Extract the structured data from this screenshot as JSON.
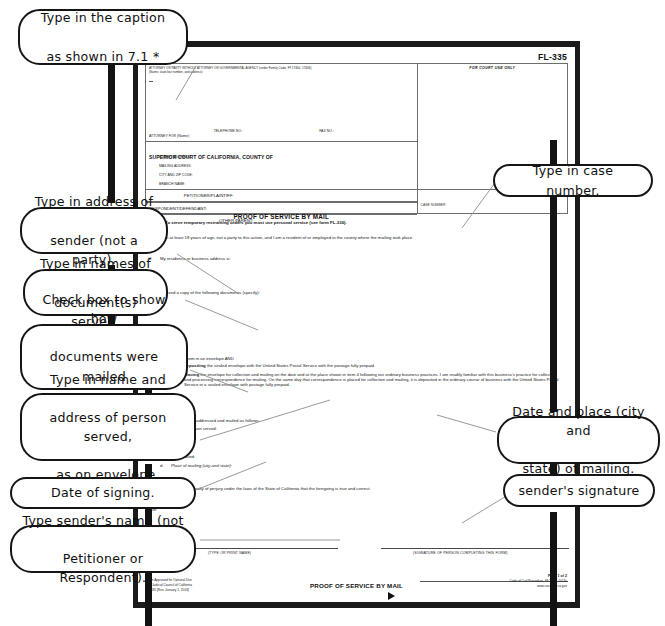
{
  "document": {
    "form_number": "FL-335",
    "attorney_box": {
      "header_line1": "ATTORNEY OR PARTY WITHOUT ATTORNEY OR GOVERNMENTAL AGENCY (under Family Code, §§ 17400, 17406)",
      "header_line2": "(Name, state bar number, and address):",
      "telephone_label": "TELEPHONE NO.:",
      "fax_label": "FAX NO.:",
      "attorney_for_label": "ATTORNEY FOR (Name):"
    },
    "for_court_use_only": "FOR COURT USE ONLY",
    "court": {
      "title": "SUPERIOR COURT OF CALIFORNIA, COUNTY OF",
      "street_address": "STREET ADDRESS:",
      "mailing_address": "MAILING ADDRESS:",
      "city_and_zip": "CITY AND ZIP CODE:",
      "branch_name": "BRANCH NAME:"
    },
    "parties": {
      "petitioner": "PETITIONER/PLAINTIFF:",
      "respondent": "RESPONDENT/DEFENDANT:",
      "other_parent": "OTHER PARENT:"
    },
    "form_title": "PROOF OF SERVICE BY MAIL",
    "case_number_label": "CASE NUMBER:",
    "notice": "NOTICE: To serve temporary restraining orders you must use personal service (see form FL-330).",
    "items": [
      {
        "num": "1.",
        "text": "I am at least 18 years of age, not a party to this action, and I am a resident of or employed in the county where the mailing took place."
      },
      {
        "num": "2.",
        "text": "My residence or business address is:"
      },
      {
        "num": "3.",
        "text": "I served a copy of the following documents (specify):"
      }
    ],
    "envelope_intro": "by enclosing them in an envelope AND",
    "checkboxes": [
      {
        "letter": "a.",
        "bold": "depositing",
        "text": "the sealed envelope with the United States Postal Service with the postage fully prepaid.",
        "checked": false
      },
      {
        "letter": "b.",
        "bold": "placing",
        "text": "the envelope for collection and mailing on the date and at the place shown in item 4 following our ordinary business practices. I am readily familiar with this business's practice for collecting and processing correspondence for mailing. On the same day that correspondence is placed for collection and mailing, it is deposited in the ordinary course of business with the United States Postal Service in a sealed envelope with postage fully prepaid.",
        "checked": false
      }
    ],
    "item4": {
      "num": "4.",
      "text": "The envelope was addressed and mailed as follows:",
      "subitems": [
        {
          "letter": "a.",
          "text": "Name of person served:"
        },
        {
          "letter": "b.",
          "text": "Address:"
        },
        {
          "letter": "c.",
          "text": "Date mailed:"
        },
        {
          "letter": "d.",
          "text": "Place of mailing (city and state):"
        }
      ]
    },
    "item5": {
      "num": "5.",
      "text": "I declare under penalty of perjury under the laws of the State of California that the foregoing is true and correct."
    },
    "date_label": "Date:",
    "signature_captions": {
      "left": "(TYPE OR PRINT NAME)",
      "right": "(SIGNATURE OF PERSON COMPLETING THIS FORM)"
    },
    "footer": {
      "left_line1": "Form Approved for Optional Use",
      "left_line2": "Judicial Council of California",
      "left_line3": "FL-335 [Rev. January 1, 2003]",
      "center": "PROOF OF SERVICE BY MAIL",
      "page_number": "Page 1 of 2",
      "right_line1": "Code of Civil Procedure, §§ 1013, 1013a",
      "right_line2": "www.courtinfo.ca.gov"
    }
  },
  "annotations": {
    "left": [
      {
        "id": "caption",
        "lines": [
          "Type in the caption",
          "as shown in 7.1 *"
        ]
      },
      {
        "id": "sender-address",
        "lines": [
          "Type in address of",
          "sender (not a party)."
        ]
      },
      {
        "id": "documents-served",
        "lines": [
          "Type in names of",
          "document(s) served."
        ]
      },
      {
        "id": "check-box",
        "lines": [
          "Check box to show how",
          "documents were mailed",
          "(probably box 3a)."
        ]
      },
      {
        "id": "person-served",
        "lines": [
          "Type in name and",
          "address of person served,",
          "as on envelope."
        ]
      },
      {
        "id": "date-of-signing",
        "lines": [
          "Date of signing."
        ]
      },
      {
        "id": "sender-name",
        "lines": [
          "Type sender's name (not",
          "Petitioner or Respondent)."
        ]
      }
    ],
    "right": [
      {
        "id": "case-number",
        "lines": [
          "Type in case number."
        ]
      },
      {
        "id": "date-place-mailing",
        "lines": [
          "Date and place (city and",
          "state) of mailing."
        ]
      },
      {
        "id": "senders-signature",
        "lines": [
          "sender's signature"
        ]
      }
    ]
  },
  "colors": {
    "ink": "#111111",
    "page": "#ffffff",
    "border": "#1b1b1b",
    "rule": "#6d6d6d"
  }
}
